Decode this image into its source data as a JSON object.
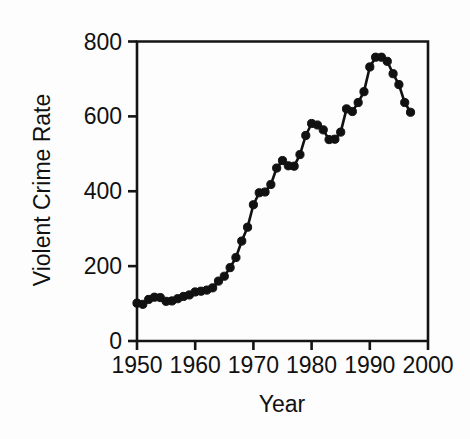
{
  "chart_data": {
    "type": "line",
    "title": "",
    "xlabel": "Year",
    "ylabel": "Violent Crime Rate",
    "xlim": [
      1950,
      2000
    ],
    "ylim": [
      0,
      800
    ],
    "xticks": [
      1950,
      1960,
      1970,
      1980,
      1990,
      2000
    ],
    "xtick_labels": [
      "1950",
      "1960",
      "1970",
      "1980",
      "1990",
      "2000"
    ],
    "yticks": [
      0,
      200,
      400,
      600,
      800
    ],
    "ytick_labels": [
      "0",
      "200",
      "400",
      "600",
      "800"
    ],
    "grid": false,
    "legend": null,
    "marker": "filled-circle",
    "line_color": "#111111",
    "marker_color": "#111111",
    "background_color": "#fdfdfd",
    "series": [
      {
        "name": "Violent Crime Rate",
        "x": [
          1950,
          1951,
          1952,
          1953,
          1954,
          1955,
          1956,
          1957,
          1958,
          1959,
          1960,
          1961,
          1962,
          1963,
          1964,
          1965,
          1966,
          1967,
          1968,
          1969,
          1970,
          1971,
          1972,
          1973,
          1974,
          1975,
          1976,
          1977,
          1978,
          1979,
          1980,
          1981,
          1982,
          1983,
          1984,
          1985,
          1986,
          1987,
          1988,
          1989,
          1990,
          1991,
          1992,
          1993,
          1994,
          1995,
          1996,
          1997
        ],
        "values": [
          101,
          98,
          111,
          117,
          116,
          106,
          107,
          113,
          119,
          123,
          131,
          133,
          136,
          142,
          160,
          173,
          196,
          223,
          267,
          304,
          364,
          396,
          398,
          418,
          462,
          482,
          468,
          467,
          498,
          549,
          581,
          577,
          564,
          538,
          539,
          558,
          620,
          613,
          637,
          666,
          732,
          758,
          758,
          747,
          714,
          685,
          637,
          611
        ]
      }
    ]
  },
  "axes": {
    "y_title": "Violent Crime Rate",
    "x_title": "Year"
  }
}
